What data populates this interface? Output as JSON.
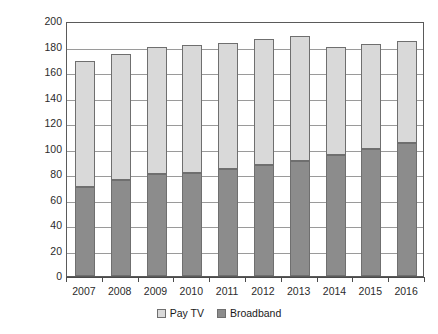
{
  "chart_data": {
    "type": "bar",
    "subtype": "stacked-column",
    "title": "",
    "xlabel": "",
    "ylabel": "Millions of Subscribers",
    "ylim": [
      0,
      200
    ],
    "yticks": [
      0,
      20,
      40,
      60,
      80,
      100,
      120,
      140,
      160,
      180,
      200
    ],
    "ytick_labels": [
      "0",
      "20",
      "40",
      "60",
      "80",
      "100",
      "120",
      "140",
      "160",
      "180",
      "200"
    ],
    "grid": true,
    "grid_axis": "y",
    "legend_position": "bottom-center",
    "categories": [
      "2007",
      "2008",
      "2009",
      "2010",
      "2011",
      "2012",
      "2013",
      "2014",
      "2015",
      "2016"
    ],
    "series": [
      {
        "name": "Broadband",
        "color": "#8c8c8c",
        "values": [
          70,
          75,
          80,
          81,
          84,
          87,
          90,
          95,
          100,
          104
        ]
      },
      {
        "name": "Pay TV",
        "color": "#d9d9d9",
        "values": [
          99,
          99,
          100,
          100,
          99,
          99,
          98,
          85,
          82,
          80
        ]
      }
    ],
    "stack_order": [
      "Broadband",
      "Pay TV"
    ],
    "totals": [
      169,
      174,
      180,
      181,
      183,
      186,
      188,
      180,
      182,
      184
    ]
  },
  "legend": {
    "items": [
      {
        "label": "Pay TV",
        "swatch": "paytv"
      },
      {
        "label": "Broadband",
        "swatch": "broadband"
      }
    ]
  }
}
